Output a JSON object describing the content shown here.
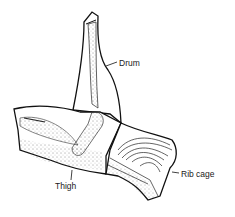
{
  "diagram": {
    "labels": {
      "drum": "Drum",
      "rib_cage": "Rib cage",
      "thigh": "Thigh"
    },
    "colors": {
      "line": "#111111",
      "background": "#ffffff"
    }
  }
}
